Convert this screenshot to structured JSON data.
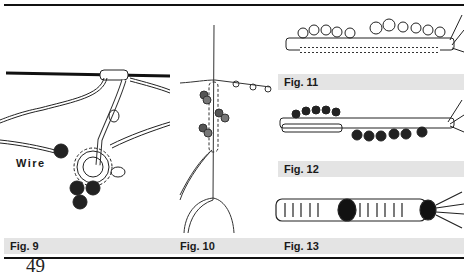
{
  "figures": [
    {
      "id": "fig9",
      "caption": "Fig. 9",
      "label": "Wire"
    },
    {
      "id": "fig10",
      "caption": "Fig. 10"
    },
    {
      "id": "fig11",
      "caption": "Fig. 11"
    },
    {
      "id": "fig12",
      "caption": "Fig. 12"
    },
    {
      "id": "fig13",
      "caption": "Fig. 13"
    }
  ],
  "page_number": "49",
  "colors": {
    "caption_bg": "#e4e4e4",
    "rule": "#111111",
    "ink": "#1a1a1a"
  }
}
